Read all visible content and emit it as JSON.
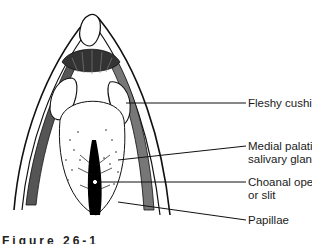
{
  "figure": {
    "caption": "Figure 26-1",
    "labels": [
      {
        "id": "fleshy-cushions",
        "lines": [
          "Fleshy cushions"
        ]
      },
      {
        "id": "medial-palatine",
        "lines": [
          "Medial palatine",
          "salivary glands"
        ]
      },
      {
        "id": "choanal-opening",
        "lines": [
          "Choanal opening",
          "or slit"
        ]
      },
      {
        "id": "papillae",
        "lines": [
          "Papillae"
        ]
      }
    ]
  }
}
